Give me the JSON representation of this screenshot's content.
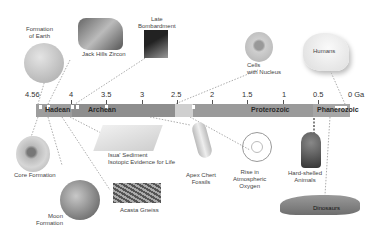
{
  "axis": {
    "unit_label": "0 Ga",
    "ticks": [
      "4.56",
      "4",
      "3.5",
      "3",
      "2.5",
      "2",
      "1.5",
      "1",
      "0.5"
    ]
  },
  "eons": [
    {
      "name": "Hadean",
      "start": 4.56,
      "end": 4.0,
      "color": "#9a9a9a"
    },
    {
      "name": "Archean",
      "start": 4.0,
      "end": 2.5,
      "color": "#8c8c8c"
    },
    {
      "name": "",
      "start": 2.5,
      "end": 2.3,
      "color": "#c8c8c8"
    },
    {
      "name": "Proterozoic",
      "start": 2.3,
      "end": 0.54,
      "color": "#999999"
    },
    {
      "name": "Phanerozoic",
      "start": 0.54,
      "end": 0.0,
      "color": "#a8a8a8"
    }
  ],
  "events": {
    "formation_of_earth": "Formation\nof Earth",
    "jack_hills_zircon": "Jack Hills Zircon",
    "late_bombardment": "Late\nBombardment",
    "cells_with_nucleus": "Cells\nwith Nucleus",
    "humans": "Humans",
    "core_formation": "Core Formation",
    "moon_formation": "Moon\nFormation",
    "isua_sediment": "Isua' Sediment\nIsotopic Evidence for Life",
    "acasta_gneiss": "Acasta Gneiss",
    "apex_chert_fossils": "Apex Chert\nFossils",
    "rise_in_oxygen": "Rise in\nAtmospheric\nOxygen",
    "hard_shelled_animals": "Hard-shelled\nAnimals",
    "dinosaurs": "Dinosaurs"
  }
}
